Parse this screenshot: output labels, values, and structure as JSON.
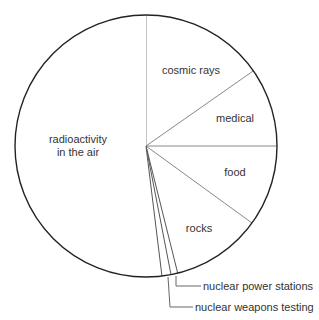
{
  "chart_data": {
    "type": "pie",
    "title": "",
    "start_angle_deg": 0,
    "direction": "clockwise",
    "unit": "degrees",
    "slices": [
      {
        "label": "cosmic rays",
        "value": 55,
        "label_lines": [
          "cosmic rays"
        ],
        "label_pos": [
          191,
          74
        ]
      },
      {
        "label": "medical",
        "value": 35,
        "label_lines": [
          "medical"
        ],
        "label_pos": [
          235,
          122
        ]
      },
      {
        "label": "food",
        "value": 36,
        "label_lines": [
          "food"
        ],
        "label_pos": [
          235,
          176
        ]
      },
      {
        "label": "rocks",
        "value": 40,
        "label_lines": [
          "rocks"
        ],
        "label_pos": [
          199,
          232
        ]
      },
      {
        "label": "nuclear power stations",
        "value": 3,
        "leader": true
      },
      {
        "label": "nuclear weapons testing",
        "value": 4,
        "leader": true
      },
      {
        "label": "radioactivity in the air",
        "value": 187,
        "label_lines": [
          "radioactivity",
          "in the air"
        ],
        "label_pos": [
          78,
          143
        ]
      }
    ],
    "leaders": [
      {
        "label": "nuclear power stations",
        "from": [
          176,
          276
        ],
        "elbow": [
          176,
          286
        ],
        "to": [
          201,
          286
        ],
        "text_pos": [
          203,
          290
        ]
      },
      {
        "label": "nuclear weapons testing",
        "from": [
          168,
          277
        ],
        "elbow": [
          170,
          307
        ],
        "to": [
          193,
          307
        ],
        "text_pos": [
          195,
          311
        ]
      }
    ],
    "legend": "none",
    "colors": {
      "fill": "#ffffff",
      "outline": "#222222",
      "divider": "#888888",
      "text": "#333333"
    }
  }
}
